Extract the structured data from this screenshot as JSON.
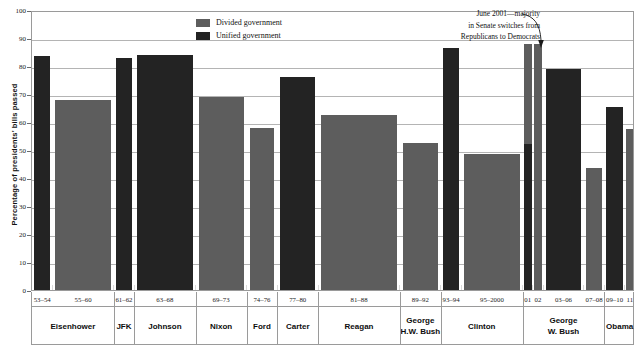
{
  "chart_data": {
    "type": "bar",
    "title": "",
    "subtitle": "",
    "xlabel": "",
    "ylabel": "Percentage of presidents' bills passed",
    "ylim": [
      0,
      100
    ],
    "yticks": [
      0,
      10,
      20,
      30,
      40,
      50,
      60,
      70,
      80,
      90,
      100
    ],
    "grid": true,
    "legend_position": "top-center",
    "legend": [
      {
        "label": "Divided government",
        "color": "#5d5d5d",
        "key": "divided"
      },
      {
        "label": "Unified government",
        "color": "#232323",
        "key": "unified"
      }
    ],
    "categories": [
      "53–54",
      "55–60",
      "61–62",
      "63–68",
      "69–73",
      "74–76",
      "77–80",
      "81–88",
      "89–92",
      "93–94",
      "95–2000",
      "01",
      "02",
      "03–06",
      "07–08",
      "09–10",
      "11"
    ],
    "values": [
      83.5,
      68,
      83,
      84,
      69,
      58,
      76,
      62.5,
      52.5,
      86.5,
      48.5,
      88,
      88,
      79,
      43.5,
      65.5,
      57.5
    ],
    "government": [
      "unified",
      "divided",
      "unified",
      "unified",
      "divided",
      "divided",
      "unified",
      "divided",
      "divided",
      "unified",
      "divided",
      "unified",
      "divided",
      "unified",
      "divided",
      "unified",
      "divided"
    ],
    "annotations": [
      {
        "lines": [
          "June 2001—majority",
          "in Senate switches from",
          "Republicans to Democrats"
        ],
        "target_category": "01"
      }
    ],
    "presidents": [
      {
        "name": "Eisenhower",
        "categories": [
          "53–54",
          "55–60"
        ]
      },
      {
        "name": "JFK",
        "categories": [
          "61–62"
        ]
      },
      {
        "name": "Johnson",
        "categories": [
          "63–68"
        ]
      },
      {
        "name": "Nixon",
        "categories": [
          "69–73"
        ]
      },
      {
        "name": "Ford",
        "categories": [
          "74–76"
        ]
      },
      {
        "name": "Carter",
        "categories": [
          "77–80"
        ]
      },
      {
        "name": "Reagan",
        "categories": [
          "81–88"
        ]
      },
      {
        "name": "George H.W. Bush",
        "categories": [
          "89–92"
        ]
      },
      {
        "name": "Clinton",
        "categories": [
          "93–94",
          "95–2000"
        ]
      },
      {
        "name": "George W. Bush",
        "categories": [
          "01",
          "02",
          "03–06",
          "07–08"
        ]
      },
      {
        "name": "Obama",
        "categories": [
          "09–10",
          "11"
        ]
      }
    ]
  }
}
